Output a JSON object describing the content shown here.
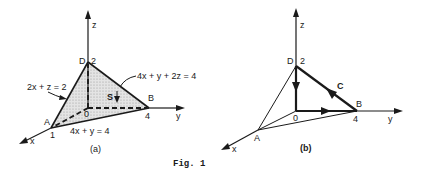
{
  "figure": {
    "caption": "Fig. 1",
    "colors": {
      "ink": "#1a1a1a",
      "surface_fill": "#d6d6d6",
      "background": "#ffffff"
    },
    "panel_a": {
      "label": "(a)",
      "axes": {
        "x": "x",
        "y": "y",
        "z": "z"
      },
      "points": {
        "origin": "0",
        "A": "A",
        "A_value": "1",
        "B": "B",
        "B_value": "4",
        "D": "D",
        "D_value": "2"
      },
      "surface_label": "S",
      "equations": {
        "plane": "4x + y + 2z = 4",
        "xz_trace": "2x + z = 2",
        "xy_trace": "4x + y = 4"
      }
    },
    "panel_b": {
      "label": "(b)",
      "axes": {
        "x": "x",
        "y": "y",
        "z": "z"
      },
      "points": {
        "origin": "0",
        "A": "A",
        "B": "B",
        "B_value": "4",
        "D": "D",
        "D_value": "2"
      },
      "curve_label": "C"
    }
  }
}
